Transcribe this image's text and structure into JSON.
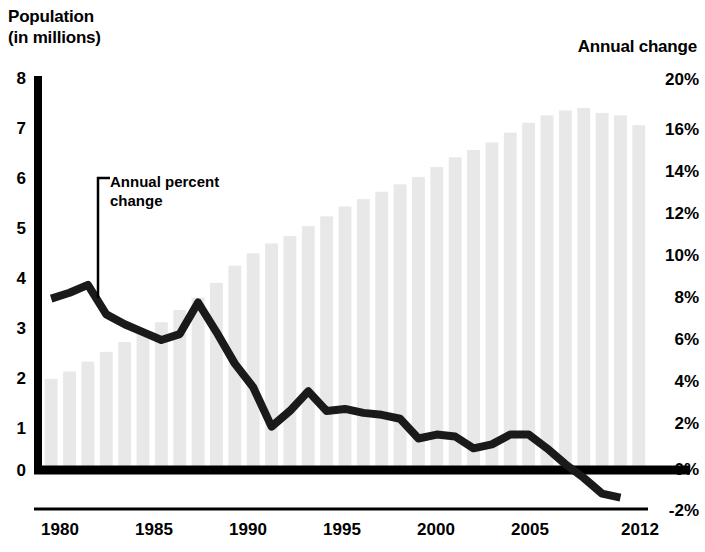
{
  "titles": {
    "left_axis": "Population\n(in millions)",
    "right_axis": "Annual change"
  },
  "annotation": {
    "text": "Annual percent\nchange"
  },
  "colors": {
    "bar": "#e8e8e8",
    "line": "#1a1a1a",
    "axis": "#000000",
    "text": "#000000"
  },
  "chart_data": {
    "type": "bar",
    "title": "",
    "subtitle": "",
    "xlabel": "",
    "ylabel": "Population (in millions)",
    "y2label": "Annual change",
    "grid": false,
    "legend": "none",
    "ylim": [
      0,
      8
    ],
    "y2lim": [
      -2,
      20
    ],
    "xlim": [
      1980,
      2012
    ],
    "x_tick_labels": [
      "1980",
      "1985",
      "1990",
      "1995",
      "2000",
      "2005",
      "2012"
    ],
    "x_tick_values": [
      1980,
      1985,
      1990,
      1995,
      2000,
      2005,
      2012
    ],
    "y_tick_labels": [
      "8",
      "7",
      "6",
      "5",
      "4",
      "3",
      "2",
      "1",
      "0"
    ],
    "y_tick_values": [
      8,
      7,
      6,
      5,
      4,
      3,
      2,
      1,
      0
    ],
    "y2_tick_labels": [
      "20%",
      "16%",
      "14%",
      "12%",
      "10%",
      "8%",
      "6%",
      "4%",
      "2%",
      "0%",
      "-2%"
    ],
    "y2_tick_values": [
      20,
      16,
      14,
      12,
      10,
      8,
      6,
      4,
      2,
      0,
      -2
    ],
    "categories": [
      1980,
      1981,
      1982,
      1983,
      1984,
      1985,
      1986,
      1987,
      1988,
      1989,
      1990,
      1991,
      1992,
      1993,
      1994,
      1995,
      1996,
      1997,
      1998,
      1999,
      2000,
      2001,
      2002,
      2003,
      2004,
      2005,
      2006,
      2007,
      2008,
      2009,
      2010,
      2011,
      2012
    ],
    "series": [
      {
        "name": "Population (in millions)",
        "type": "bar",
        "axis": "left",
        "units": "millions",
        "values": [
          1.85,
          2.0,
          2.2,
          2.4,
          2.6,
          2.8,
          3.0,
          3.25,
          3.5,
          3.8,
          4.15,
          4.4,
          4.6,
          4.75,
          4.95,
          5.15,
          5.35,
          5.5,
          5.65,
          5.8,
          5.95,
          6.15,
          6.35,
          6.5,
          6.65,
          6.85,
          7.05,
          7.2,
          7.3,
          7.35,
          7.25,
          7.2,
          7.0
        ]
      },
      {
        "name": "Annual percent change",
        "type": "line",
        "axis": "right",
        "units": "percent",
        "values": [
          8.7,
          9.0,
          9.4,
          7.9,
          7.4,
          7.0,
          6.6,
          6.9,
          8.5,
          7.0,
          5.4,
          4.2,
          2.2,
          3.0,
          4.0,
          3.0,
          3.1,
          2.9,
          2.8,
          2.6,
          1.6,
          1.8,
          1.7,
          1.1,
          1.3,
          1.8,
          1.8,
          1.1,
          0.3,
          -0.4,
          -1.2,
          -1.4,
          null
        ]
      }
    ],
    "annotations": [
      {
        "text": "Annual percent change",
        "points_to_year": 1981,
        "points_to_value": 8.7
      }
    ]
  }
}
